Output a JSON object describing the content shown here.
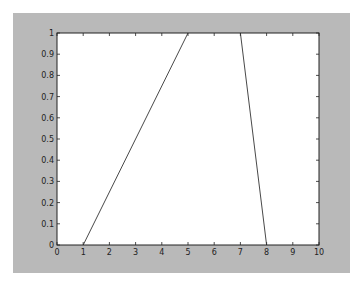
{
  "chart_data": {
    "type": "line",
    "title": "",
    "xlabel": "",
    "ylabel": "",
    "xlim": [
      0,
      10
    ],
    "ylim": [
      0,
      1
    ],
    "grid": false,
    "legend": null,
    "x_ticks": [
      "0",
      "1",
      "2",
      "3",
      "4",
      "5",
      "6",
      "7",
      "8",
      "9",
      "10"
    ],
    "y_ticks": [
      "0",
      "0.1",
      "0.2",
      "0.3",
      "0.4",
      "0.5",
      "0.6",
      "0.7",
      "0.8",
      "0.9",
      "1"
    ],
    "series": [
      {
        "name": "rising-segment",
        "x": [
          1,
          5
        ],
        "y": [
          0,
          1
        ]
      },
      {
        "name": "falling-segment",
        "x": [
          7,
          8
        ],
        "y": [
          1,
          0
        ]
      }
    ]
  },
  "colors": {
    "figure_background": "#b9b9b9",
    "axes_background": "#ffffff",
    "line": "#333333",
    "axis": "#222222"
  }
}
